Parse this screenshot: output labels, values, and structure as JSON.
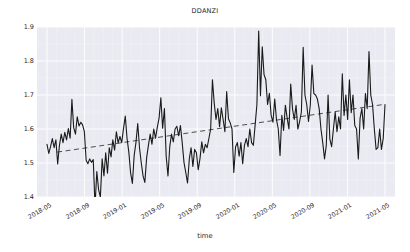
{
  "chart_data": {
    "type": "line",
    "title": "DDANZI",
    "xlabel": "time",
    "ylabel": "",
    "ylim": [
      1.4,
      1.9
    ],
    "xlim": [
      "2018-05",
      "2021-07"
    ],
    "grid": true,
    "legend": null,
    "y_ticks": [
      "1.4",
      "1.5",
      "1.6",
      "1.7",
      "1.8",
      "1.9"
    ],
    "y_tick_values": [
      1.4,
      1.5,
      1.6,
      1.7,
      1.8,
      1.9
    ],
    "x_ticks": [
      "2018-05",
      "2018-09",
      "2019-01",
      "2019-05",
      "2019-09",
      "2020-01",
      "2020-05",
      "2020-09",
      "2021-01",
      "2021-05"
    ],
    "series": [
      {
        "name": "DDANZI",
        "style": "solid",
        "color": "#1a1a1a",
        "linewidth": 1.1,
        "values": [
          1.555,
          1.528,
          1.548,
          1.572,
          1.545,
          1.568,
          1.497,
          1.552,
          1.585,
          1.56,
          1.59,
          1.568,
          1.601,
          1.573,
          1.687,
          1.604,
          1.585,
          1.636,
          1.609,
          1.62,
          1.612,
          1.592,
          1.508,
          1.498,
          1.512,
          1.502,
          1.51,
          1.372,
          1.475,
          1.422,
          1.4,
          1.512,
          1.462,
          1.53,
          1.47,
          1.545,
          1.518,
          1.568,
          1.538,
          1.592,
          1.559,
          1.578,
          1.56,
          1.601,
          1.638,
          1.572,
          1.532,
          1.471,
          1.44,
          1.522,
          1.56,
          1.616,
          1.545,
          1.5,
          1.462,
          1.443,
          1.515,
          1.552,
          1.585,
          1.555,
          1.6,
          1.573,
          1.605,
          1.632,
          1.692,
          1.602,
          1.66,
          1.52,
          1.462,
          1.548,
          1.585,
          1.562,
          1.6,
          1.608,
          1.58,
          1.61,
          1.56,
          1.502,
          1.472,
          1.441,
          1.512,
          1.545,
          1.49,
          1.54,
          1.53,
          1.48,
          1.513,
          1.562,
          1.53,
          1.555,
          1.545,
          1.572,
          1.6,
          1.745,
          1.676,
          1.628,
          1.66,
          1.607,
          1.662,
          1.628,
          1.592,
          1.71,
          1.63,
          1.618,
          1.6,
          1.472,
          1.548,
          1.56,
          1.52,
          1.56,
          1.498,
          1.552,
          1.572,
          1.548,
          1.6,
          1.56,
          1.552,
          1.612,
          1.672,
          1.888,
          1.698,
          1.842,
          1.76,
          1.745,
          1.672,
          1.705,
          1.64,
          1.62,
          1.688,
          1.628,
          1.6,
          1.522,
          1.64,
          1.596,
          1.67,
          1.632,
          1.6,
          1.732,
          1.66,
          1.628,
          1.67,
          1.6,
          1.622,
          1.65,
          1.84,
          1.7,
          1.672,
          1.622,
          1.67,
          1.788,
          1.704,
          1.7,
          1.688,
          1.66,
          1.6,
          1.56,
          1.512,
          1.552,
          1.7,
          1.57,
          1.548,
          1.6,
          1.65,
          1.592,
          1.636,
          1.6,
          1.762,
          1.64,
          1.7,
          1.628,
          1.745,
          1.648,
          1.7,
          1.61,
          1.6,
          1.512,
          1.632,
          1.66,
          1.6,
          1.704,
          1.66,
          1.828,
          1.7,
          1.672,
          1.6,
          1.54,
          1.545,
          1.6,
          1.54,
          1.572,
          1.672
        ]
      },
      {
        "name": "trend",
        "style": "dashed",
        "color": "#4d4d4d",
        "linewidth": 1.0,
        "endpoints": [
          {
            "x_frac": 0.03,
            "y": 1.532
          },
          {
            "x_frac": 0.995,
            "y": 1.672
          }
        ]
      }
    ]
  }
}
